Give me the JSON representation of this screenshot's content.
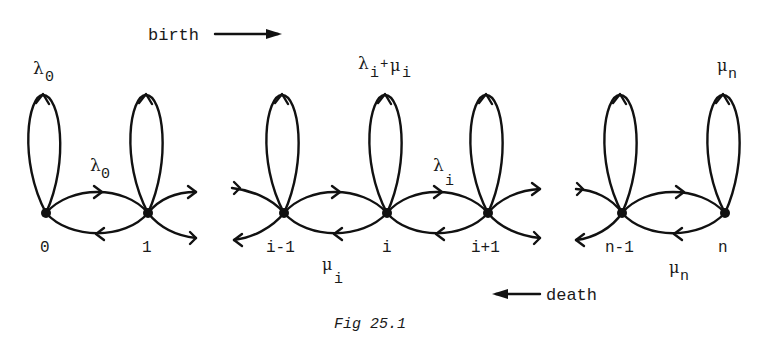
{
  "figure": {
    "caption": "Fig 25.1",
    "direction_labels": {
      "birth": "birth",
      "death": "death"
    },
    "states": [
      {
        "id": "0",
        "label": "0"
      },
      {
        "id": "1",
        "label": "1"
      },
      {
        "id": "i-1",
        "label": "i-1"
      },
      {
        "id": "i",
        "label": "i"
      },
      {
        "id": "i+1",
        "label": "i+1"
      },
      {
        "id": "n-1",
        "label": "n-1"
      },
      {
        "id": "n",
        "label": "n"
      }
    ],
    "rate_labels": {
      "self_loop_0": {
        "base": "λ",
        "sub": "0"
      },
      "forward_0": {
        "base": "λ",
        "sub": "0"
      },
      "self_loop_i": {
        "base1": "λ",
        "sub1": "i",
        "op": "+",
        "base2": "μ",
        "sub2": "i"
      },
      "forward_i": {
        "base": "λ",
        "sub": "i"
      },
      "backward_i": {
        "base": "μ",
        "sub": "i"
      },
      "self_loop_n": {
        "base": "μ",
        "sub": "n"
      },
      "backward_n": {
        "base": "μ",
        "sub": "n"
      }
    }
  }
}
